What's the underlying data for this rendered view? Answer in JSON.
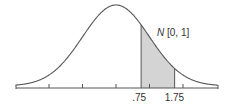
{
  "chart_data": {
    "type": "area",
    "title": "",
    "distribution_label": "N [0, 1]",
    "distribution_symbol": "N",
    "distribution_params": "[0, 1]",
    "mean": 0,
    "std": 1,
    "shaded_region": {
      "from": 0.75,
      "to": 1.75
    },
    "tick_labels": [
      ".75",
      "1.75"
    ],
    "xlabel": "",
    "ylabel": "",
    "grid": false,
    "colors": {
      "curve": "#555555",
      "shade": "#d4d4d4",
      "axis": "#555555"
    }
  }
}
